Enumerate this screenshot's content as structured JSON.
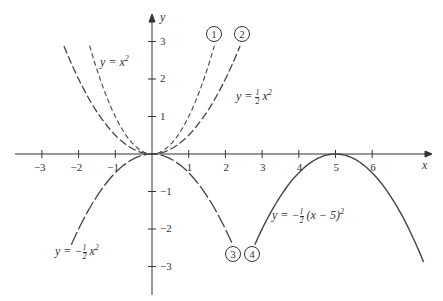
{
  "chart_data": {
    "type": "line",
    "title": "",
    "xlabel": "x",
    "ylabel": "y",
    "xlim": [
      -3.3,
      7.6
    ],
    "ylim": [
      -3.4,
      3.4
    ],
    "x_ticks": [
      "−3",
      "−2",
      "−1",
      "1",
      "2",
      "3",
      "4",
      "5",
      "6"
    ],
    "y_ticks": [
      "3",
      "2",
      "1",
      "−1",
      "−2",
      "−3"
    ],
    "grid": false,
    "series": [
      {
        "id": "1",
        "name": "y = x²",
        "style": "dashed-short",
        "x_range": [
          -1.7,
          1.7
        ]
      },
      {
        "id": "2",
        "name": "y = ½x²",
        "style": "dashed-long",
        "x_range": [
          -2.4,
          2.4
        ]
      },
      {
        "id": "3",
        "name": "y = −½x²",
        "style": "dashed-long/solid",
        "x_range": [
          -2.2,
          2.2
        ]
      },
      {
        "id": "4",
        "name": "y = −½(x − 5)²",
        "style": "solid",
        "x_range": [
          2.8,
          7.4
        ]
      }
    ]
  },
  "labels": {
    "x_axis": "x",
    "y_axis": "y",
    "curve1": "y = x",
    "curve2_a": "y =",
    "curve2_b": "x",
    "curve3_a": "y = −",
    "curve3_b": "x",
    "curve4_a": "y = −",
    "curve4_b": "(x − 5)",
    "sup2": "2",
    "half_n": "1",
    "half_d": "2",
    "circ1": "1",
    "circ2": "2",
    "circ3": "3",
    "circ4": "4"
  },
  "ticks": {
    "x": [
      {
        "v": -3,
        "t": "−3"
      },
      {
        "v": -2,
        "t": "−2"
      },
      {
        "v": -1,
        "t": "−1"
      },
      {
        "v": 1,
        "t": "1"
      },
      {
        "v": 2,
        "t": "2"
      },
      {
        "v": 3,
        "t": "3"
      },
      {
        "v": 4,
        "t": "4"
      },
      {
        "v": 5,
        "t": "5"
      },
      {
        "v": 6,
        "t": "6"
      }
    ],
    "y": [
      {
        "v": 3,
        "t": "3"
      },
      {
        "v": 2,
        "t": "2"
      },
      {
        "v": 1,
        "t": "1"
      },
      {
        "v": -1,
        "t": "−1"
      },
      {
        "v": -2,
        "t": "−2"
      },
      {
        "v": -3,
        "t": "−3"
      }
    ]
  }
}
